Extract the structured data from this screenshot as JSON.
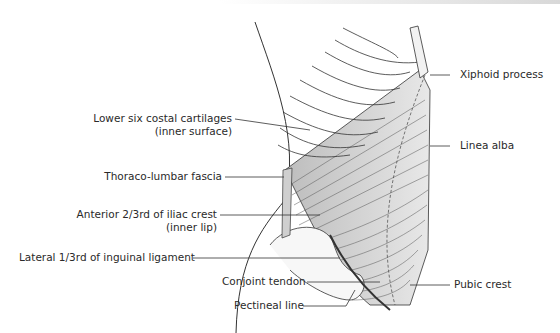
{
  "figure": {
    "labels_left": [
      {
        "id": "costal",
        "line1": "Lower six costal cartilages",
        "line2": "(inner surface)"
      },
      {
        "id": "fascia",
        "line1": "Thoraco-lumbar fascia"
      },
      {
        "id": "iliac",
        "line1": "Anterior 2/3rd of iliac crest",
        "line2": "(inner lip)"
      },
      {
        "id": "inguinal",
        "line1": "Lateral 1/3rd of inguinal ligament"
      },
      {
        "id": "conjoint",
        "line1": "Conjoint tendon"
      },
      {
        "id": "pectineal",
        "line1": "Pectineal line"
      }
    ],
    "labels_right": [
      {
        "id": "xiphoid",
        "line1": "Xiphoid process"
      },
      {
        "id": "linea",
        "line1": "Linea alba"
      },
      {
        "id": "pubic",
        "line1": "Pubic crest"
      }
    ],
    "colors": {
      "line": "#333333",
      "muscle_fill": "#d9d9d9",
      "cartilage_fill": "#e6e6e6"
    }
  }
}
